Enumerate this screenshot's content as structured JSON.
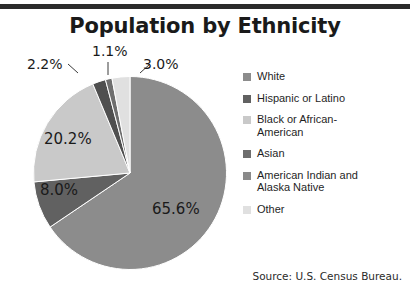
{
  "chart_data": {
    "type": "pie",
    "title": "Population by Ethnicity",
    "source": "Source: U.S. Census Bureau.",
    "legend_position": "right",
    "unit": "percent",
    "categories": [
      "White",
      "Hispanic or Latino",
      "Black or African-\nAmerican",
      "Asian",
      "American Indian and\nAlaska Native",
      "Other"
    ],
    "values": [
      65.6,
      8.0,
      20.2,
      1.1,
      2.2,
      3.0
    ],
    "value_labels": [
      "65.6%",
      "8.0%",
      "20.2%",
      "1.1%",
      "2.2%",
      "3.0%"
    ],
    "colors": [
      "#8c8c8c",
      "#616161",
      "#c9c9c9",
      "#6e6e6e",
      "#4f4f4f",
      "#e0e0e0"
    ],
    "slices": [
      {
        "name": "White",
        "value": 65.6,
        "label": "65.6%",
        "color": "#8c8c8c"
      },
      {
        "name": "Hispanic or Latino",
        "value": 8.0,
        "label": "8.0%",
        "color": "#616161"
      },
      {
        "name": "Black or African-American",
        "value": 20.2,
        "label": "20.2%",
        "color": "#c9c9c9"
      },
      {
        "name": "American Indian and Alaska Native",
        "value": 2.2,
        "label": "2.2%",
        "color": "#4f4f4f"
      },
      {
        "name": "Asian",
        "value": 1.1,
        "label": "1.1%",
        "color": "#6e6e6e"
      },
      {
        "name": "Other",
        "value": 3.0,
        "label": "3.0%",
        "color": "#e0e0e0"
      }
    ]
  },
  "title": "Population by Ethnicity",
  "source": "Source: U.S. Census Bureau.",
  "legend": {
    "items": [
      {
        "label": "White",
        "color": "#8c8c8c"
      },
      {
        "label": "Hispanic or Latino",
        "color": "#616161"
      },
      {
        "label": "Black or African-\nAmerican",
        "color": "#c9c9c9"
      },
      {
        "label": "Asian",
        "color": "#6e6e6e"
      },
      {
        "label": "American Indian and\nAlaska Native",
        "color": "#8a8a8a"
      },
      {
        "label": "Other",
        "color": "#e0e0e0"
      }
    ]
  },
  "labels": {
    "white": "65.6%",
    "hispanic": "8.0%",
    "black": "20.2%",
    "american_indian": "2.2%",
    "asian": "1.1%",
    "other": "3.0%"
  }
}
